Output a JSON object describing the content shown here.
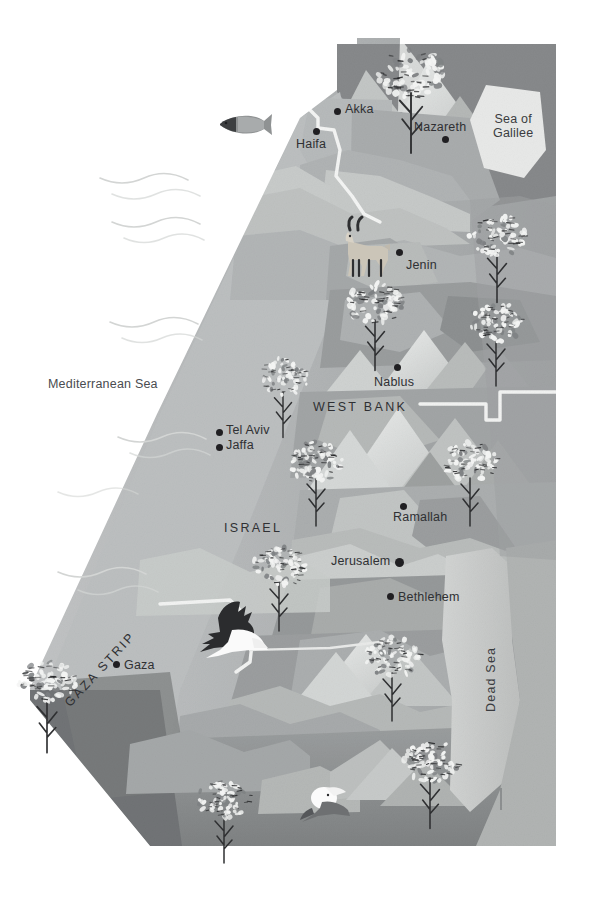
{
  "map": {
    "title": "Illustrated map of Israel and Palestine",
    "background_color": "#ffffff",
    "palette": {
      "sea_white": "#ffffff",
      "coastal_plain": "#b9bbbc",
      "land_mid": "#a8abac",
      "land_dark": "#8e9192",
      "land_darker": "#7c7f80",
      "highland_light": "#cdd0d0",
      "highland_pale": "#dddfdf",
      "mountain_light": "#e3e5e4",
      "dead_sea": "#c9cbca",
      "galilee": "#e6e7e6",
      "border_line": "#f2f3f2",
      "label_text": "#2f3033",
      "dot_color": "#201f22"
    },
    "water_labels": [
      {
        "name": "mediterranean-sea",
        "text": "Mediterranean Sea",
        "x": 48,
        "y": 377
      },
      {
        "name": "sea-of-galilee",
        "line1": "Sea of",
        "line2": "Galilee",
        "x": 493,
        "y": 112
      },
      {
        "name": "dead-sea",
        "text": "Dead Sea",
        "x": 489,
        "y": 710
      }
    ],
    "region_labels": [
      {
        "name": "west-bank",
        "text": "WEST BANK",
        "x": 313,
        "y": 400
      },
      {
        "name": "israel",
        "text": "ISRAEL",
        "x": 224,
        "y": 521
      },
      {
        "name": "gaza-strip",
        "text": "GAZA STRIP",
        "x": 62,
        "y": 700
      }
    ],
    "cities": [
      {
        "name": "akka",
        "label": "Akka",
        "dot_x": 334,
        "dot_y": 108,
        "label_x": 345,
        "label_y": 104,
        "align": "right",
        "size": "small"
      },
      {
        "name": "haifa",
        "label": "Haifa",
        "dot_x": 313,
        "dot_y": 128,
        "label_x": 297,
        "label_y": 137,
        "align": "below",
        "size": "small"
      },
      {
        "name": "nazareth",
        "label": "Nazareth",
        "dot_x": 442,
        "dot_y": 136,
        "label_x": 414,
        "label_y": 118,
        "align": "above",
        "size": "small"
      },
      {
        "name": "jenin",
        "label": "Jenin",
        "dot_x": 396,
        "dot_y": 258,
        "label_x": 406,
        "label_y": 259,
        "align": "right",
        "size": "small"
      },
      {
        "name": "nablus",
        "label": "Nablus",
        "dot_x": 394,
        "dot_y": 369,
        "label_x": 375,
        "label_y": 376,
        "align": "below",
        "size": "small"
      },
      {
        "name": "tel-aviv",
        "label": "Tel Aviv",
        "dot_x": 216,
        "dot_y": 429,
        "label_x": 226,
        "label_y": 424,
        "align": "right",
        "size": "small"
      },
      {
        "name": "jaffa",
        "label": "Jaffa",
        "dot_x": 216,
        "dot_y": 444,
        "label_x": 226,
        "label_y": 439,
        "align": "right",
        "size": "small"
      },
      {
        "name": "ramallah",
        "label": "Ramallah",
        "dot_x": 400,
        "dot_y": 503,
        "label_x": 397,
        "label_y": 511,
        "align": "below",
        "size": "small"
      },
      {
        "name": "jerusalem",
        "label": "Jerusalem",
        "dot_x": 395,
        "dot_y": 561,
        "label_x": 332,
        "label_y": 555,
        "align": "left",
        "size": "big"
      },
      {
        "name": "bethlehem",
        "label": "Bethlehem",
        "dot_x": 387,
        "dot_y": 596,
        "label_x": 396,
        "label_y": 591,
        "align": "right",
        "size": "small"
      },
      {
        "name": "gaza",
        "label": "Gaza",
        "dot_x": 113,
        "dot_y": 664,
        "label_x": 123,
        "label_y": 658,
        "align": "right",
        "size": "small"
      }
    ],
    "fauna": [
      {
        "name": "fish-icon",
        "kind": "fish",
        "x": 214,
        "y": 112,
        "width": 58,
        "height": 26
      },
      {
        "name": "ibex-icon",
        "kind": "ibex",
        "x": 340,
        "y": 218,
        "width": 52,
        "height": 62
      },
      {
        "name": "eagle-icon",
        "kind": "eagle",
        "x": 200,
        "y": 604,
        "width": 70,
        "height": 62
      },
      {
        "name": "pelican-icon",
        "kind": "pelican",
        "x": 300,
        "y": 790,
        "width": 52,
        "height": 36
      }
    ],
    "trees": [
      {
        "name": "olive-tree",
        "x": 411,
        "y": 93,
        "scale": 1.25
      },
      {
        "name": "olive-tree",
        "x": 497,
        "y": 252,
        "scale": 1.05
      },
      {
        "name": "olive-tree",
        "x": 375,
        "y": 320,
        "scale": 1.05
      },
      {
        "name": "olive-tree",
        "x": 496,
        "y": 338,
        "scale": 1.0
      },
      {
        "name": "olive-tree",
        "x": 283,
        "y": 392,
        "scale": 0.95
      },
      {
        "name": "olive-tree",
        "x": 316,
        "y": 478,
        "scale": 1.0
      },
      {
        "name": "olive-tree",
        "x": 470,
        "y": 478,
        "scale": 1.0
      },
      {
        "name": "olive-tree",
        "x": 279,
        "y": 583,
        "scale": 1.0
      },
      {
        "name": "olive-tree",
        "x": 392,
        "y": 673,
        "scale": 1.0
      },
      {
        "name": "olive-tree",
        "x": 47,
        "y": 700,
        "scale": 1.1
      },
      {
        "name": "olive-tree",
        "x": 224,
        "y": 815,
        "scale": 1.0
      },
      {
        "name": "olive-tree",
        "x": 430,
        "y": 778,
        "scale": 1.05
      }
    ],
    "wave_marks": [
      {
        "name": "wave-mark",
        "x": 110,
        "y": 178
      },
      {
        "name": "wave-mark",
        "x": 122,
        "y": 222
      },
      {
        "name": "wave-mark",
        "x": 120,
        "y": 322
      },
      {
        "name": "wave-mark",
        "x": 128,
        "y": 437
      },
      {
        "name": "wave-mark",
        "x": 68,
        "y": 492
      },
      {
        "name": "wave-mark",
        "x": 68,
        "y": 572
      },
      {
        "name": "wave-mark",
        "x": 96,
        "y": 592
      }
    ]
  }
}
